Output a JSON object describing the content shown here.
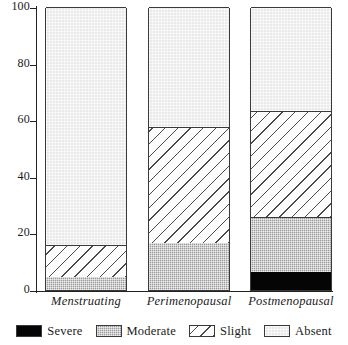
{
  "chart_data": {
    "type": "bar",
    "subtype": "stacked-percent",
    "title": "",
    "xlabel": "",
    "ylabel": "Percent",
    "ylim": [
      0,
      100
    ],
    "yticks": [
      0,
      20,
      40,
      60,
      80,
      100
    ],
    "ytick_labels": [
      "0",
      "20",
      "40",
      "60",
      "80",
      "100"
    ],
    "grid": false,
    "legend_position": "bottom",
    "categories": [
      "Menstruating",
      "Perimenopausal",
      "Postmenopausal"
    ],
    "series": [
      {
        "name": "Severe",
        "values": [
          0.0,
          0.0,
          6.4
        ],
        "color": "#050505",
        "pattern": "solid"
      },
      {
        "name": "Moderate",
        "values": [
          4.6,
          16.5,
          19.4
        ],
        "color": "#9a9a9a",
        "pattern": "fine-dot"
      },
      {
        "name": "Slight",
        "values": [
          11.4,
          41.1,
          37.5
        ],
        "color": "#fdfdfd",
        "pattern": "diagonal-hatch"
      },
      {
        "name": "Absent",
        "values": [
          84.0,
          42.4,
          36.7
        ],
        "color": "#e9e9e9",
        "pattern": "light-stipple"
      }
    ],
    "cumulative_tops": {
      "Menstruating": {
        "Severe": 0.0,
        "Moderate": 4.6,
        "Slight": 16.0,
        "Absent": 100.0
      },
      "Perimenopausal": {
        "Severe": 0.0,
        "Moderate": 16.5,
        "Slight": 57.6,
        "Absent": 100.0
      },
      "Postmenopausal": {
        "Severe": 6.4,
        "Moderate": 25.8,
        "Slight": 63.3,
        "Absent": 100.0
      }
    }
  },
  "axis": {
    "y_label": "Percent",
    "ticks": [
      {
        "value": 100,
        "label": "100"
      },
      {
        "value": 80,
        "label": "80"
      },
      {
        "value": 60,
        "label": "60"
      },
      {
        "value": 40,
        "label": "40"
      },
      {
        "value": 20,
        "label": "20"
      },
      {
        "value": 0,
        "label": "0"
      }
    ]
  },
  "categories": [
    {
      "key": "menstruating",
      "label": "Menstruating"
    },
    {
      "key": "perimenopausal",
      "label": "Perimenopausal"
    },
    {
      "key": "postmenopausal",
      "label": "Postmenopausal"
    }
  ],
  "legend": {
    "items": [
      {
        "key": "severe",
        "label": "Severe",
        "color": "#050505"
      },
      {
        "key": "moderate",
        "label": "Moderate",
        "color": "#9a9a9a"
      },
      {
        "key": "slight",
        "label": "Slight",
        "color": "#fdfdfd"
      },
      {
        "key": "absent",
        "label": "Absent",
        "color": "#e9e9e9"
      }
    ]
  }
}
